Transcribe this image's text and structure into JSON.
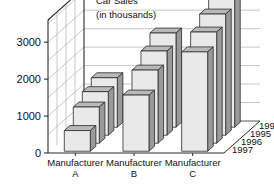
{
  "chart_data": {
    "type": "bar",
    "title": "Car Sales",
    "subtitle": "(in thousands)",
    "xlabel": "",
    "ylabel": "",
    "categories": [
      "Manufacturer A",
      "Manufacturer B",
      "Manufacturer C"
    ],
    "category_lines": [
      [
        "Manufacturer",
        "A"
      ],
      [
        "Manufacturer",
        "B"
      ],
      [
        "Manufacturer",
        "C"
      ]
    ],
    "depth_axis_label": "",
    "depth_categories": [
      "1994",
      "1995",
      "1996",
      "1997"
    ],
    "series": [
      {
        "name": "1994",
        "values": [
          1340,
          2550,
          3500
        ]
      },
      {
        "name": "1995",
        "values": [
          1180,
          2280,
          3280
        ]
      },
      {
        "name": "1996",
        "values": [
          980,
          1980,
          3010
        ]
      },
      {
        "name": "1997",
        "values": [
          560,
          1520,
          2690
        ]
      }
    ],
    "ytick_labels": [
      "0",
      "1000",
      "2000",
      "3000"
    ],
    "ytick_values": [
      0,
      1000,
      2000,
      3000
    ],
    "ylim": [
      0,
      3600
    ],
    "grid": true,
    "legend": "none",
    "gridline_values": [
      500,
      1000,
      1500,
      2000,
      2500,
      3000,
      3500
    ],
    "colors": {
      "bar_face": "#e9e9e9",
      "bar_top": "#b9b9b9",
      "bar_side": "#9a9a9a",
      "outline": "#2b2b2b",
      "grid": "#b0b0b0",
      "axis": "#2b2b2b",
      "wall": "#ffffff",
      "text": "#111111"
    }
  }
}
